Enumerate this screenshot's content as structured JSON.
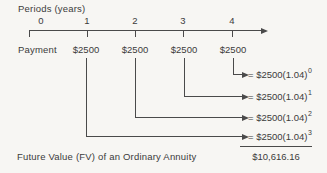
{
  "diagram": {
    "periods_label": "Periods (years)",
    "payment_label": "Payment",
    "timeline": {
      "ticks": [
        {
          "label": "0"
        },
        {
          "label": "1"
        },
        {
          "label": "2"
        },
        {
          "label": "3"
        },
        {
          "label": "4"
        }
      ]
    },
    "payments": [
      {
        "value": "$2500"
      },
      {
        "value": "$2500"
      },
      {
        "value": "$2500"
      },
      {
        "value": "$2500"
      }
    ],
    "formulas": [
      {
        "base": "= $2500(1.04)",
        "exp": "0"
      },
      {
        "base": "= $2500(1.04)",
        "exp": "1"
      },
      {
        "base": "= $2500(1.04)",
        "exp": "2"
      },
      {
        "base": "= $2500(1.04)",
        "exp": "3"
      }
    ],
    "footer": {
      "label": "Future Value (FV) of an Ordinary Annuity",
      "total": "$10,616.16"
    },
    "colors": {
      "ink": "#3b3b3b",
      "line": "#4a4a4a",
      "background": "#f7f6f3"
    }
  }
}
